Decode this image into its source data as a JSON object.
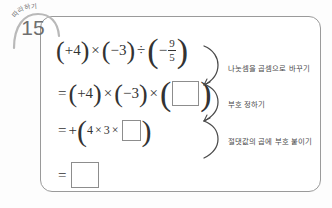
{
  "badge": {
    "label": "따라하기",
    "number": "15"
  },
  "equations": [
    {
      "id": "line1",
      "parts": [
        "(",
        "+4",
        ")",
        "×",
        "(",
        "−3",
        ")",
        "÷",
        "(",
        "−",
        "9/5",
        ")"
      ],
      "text": "(+4)×(−3)÷(−9/5)",
      "fraction": {
        "numerator": "9",
        "denominator": "5"
      },
      "lead": "",
      "sign_inside": "−"
    },
    {
      "id": "line2",
      "text": "=(+4)×(−3)×( □ )",
      "lead": "=",
      "blank": ""
    },
    {
      "id": "line3",
      "text": "=+(4×3× □ )",
      "lead": "=+",
      "blank": ""
    },
    {
      "id": "line4",
      "text": "= □",
      "lead": "=",
      "blank": ""
    }
  ],
  "symbols": {
    "times": "×",
    "divide": "÷",
    "equals": "=",
    "plus": "+",
    "minus": "−",
    "lparen": "(",
    "rparen": ")",
    "four": "4",
    "three": "3",
    "plus_four": "+4",
    "minus_three": "−3"
  },
  "notes": [
    {
      "id": "note1",
      "text": "나눗셈을 곱셈으로 바꾸기"
    },
    {
      "id": "note2",
      "text": "부호 정하기"
    },
    {
      "id": "note3",
      "text": "절댓값의 곱에 부호 붙이기"
    }
  ],
  "colors": {
    "card_border": "#9a9a9a",
    "text": "#333333",
    "note_text": "#4a4a4a",
    "badge_text": "#6f6f6f",
    "blank_border": "#8d8d8d",
    "background": "#ffffff"
  }
}
